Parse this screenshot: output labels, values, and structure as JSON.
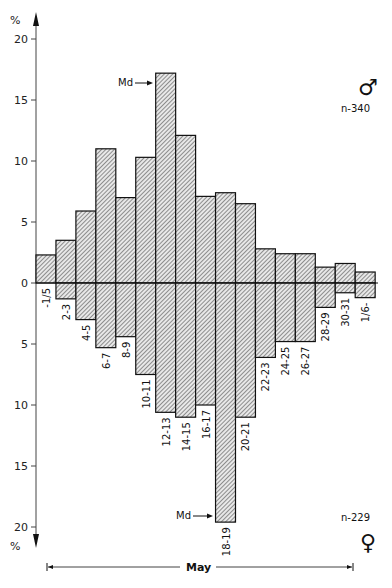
{
  "chart_data": {
    "type": "bar",
    "title": "",
    "xlabel": "May",
    "ylabel": "%",
    "layout": "back-to-back histogram (males above zero line, females below)",
    "categories": [
      "-1/5",
      "2-3",
      "4-5",
      "6-7",
      "8-9",
      "10-11",
      "12-13",
      "14-15",
      "16-17",
      "18-19",
      "20-21",
      "22-23",
      "24-25",
      "26-27",
      "28-29",
      "30-31",
      "1/6-"
    ],
    "series": [
      {
        "name": "Males",
        "symbol": "♂",
        "n_label": "n-340",
        "direction": "up",
        "values": [
          2.3,
          3.5,
          5.9,
          11.0,
          7.0,
          10.3,
          17.2,
          12.1,
          7.1,
          7.4,
          6.5,
          2.8,
          2.4,
          2.4,
          1.3,
          1.6,
          0.9
        ],
        "median_category": "12-13"
      },
      {
        "name": "Females",
        "symbol": "♀",
        "n_label": "n-229",
        "direction": "down",
        "values": [
          0,
          1.3,
          3.0,
          5.3,
          4.4,
          7.5,
          10.6,
          11.0,
          10.0,
          19.6,
          11.0,
          6.1,
          4.8,
          4.8,
          2.0,
          0.8,
          1.2
        ],
        "median_category": "18-19"
      }
    ],
    "y_ticks_up": [
      0,
      5,
      10,
      15,
      20
    ],
    "y_ticks_down": [
      5,
      10,
      15,
      20
    ],
    "ylim": [
      -20,
      20
    ],
    "grid": false,
    "legend": "none (sex symbols with sample sizes at right)",
    "annotations": [
      {
        "text": "Md",
        "arrow_to": "12-13",
        "series": "Males"
      },
      {
        "text": "Md",
        "arrow_to": "18-19",
        "series": "Females"
      }
    ],
    "hatch": "diagonal lines"
  },
  "axis": {
    "top_unit": "%",
    "bottom_unit": "%",
    "tick_labels_up": [
      "0",
      "5",
      "10",
      "15",
      "20"
    ],
    "tick_labels_down": [
      "5",
      "10",
      "15",
      "20"
    ]
  },
  "annotations": {
    "male_md": "Md",
    "female_md": "Md",
    "male_symbol": "♂",
    "female_symbol": "♀",
    "male_n": "n-340",
    "female_n": "n-229",
    "month": "May"
  }
}
